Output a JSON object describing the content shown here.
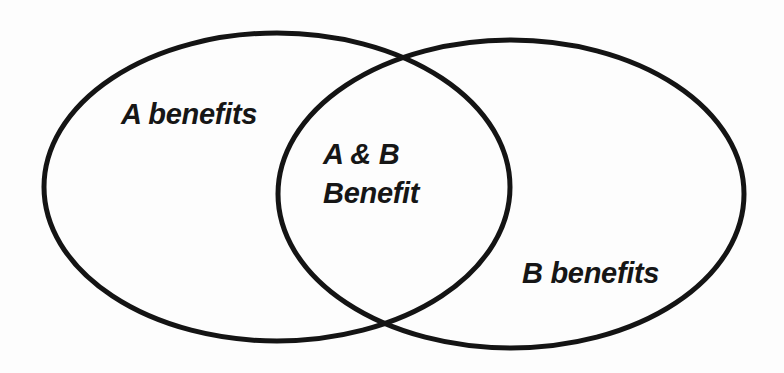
{
  "diagram": {
    "type": "venn",
    "stroke_color": "#141414",
    "background_color": "#fdfdfd",
    "sets": [
      {
        "id": "A",
        "label": "A benefits"
      },
      {
        "id": "B",
        "label": "B benefits"
      }
    ],
    "intersection": {
      "line1": "A & B",
      "line2": "Benefit"
    }
  }
}
